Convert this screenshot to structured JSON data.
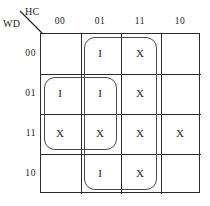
{
  "kmap": {
    "column_variables_label": "HC",
    "row_variables_label": "WD",
    "column_headers": [
      "00",
      "01",
      "11",
      "10"
    ],
    "row_headers": [
      "00",
      "01",
      "11",
      "10"
    ],
    "cells": [
      [
        "",
        "I",
        "X",
        ""
      ],
      [
        "I",
        "I",
        "X",
        ""
      ],
      [
        "X",
        "X",
        "X",
        "X"
      ],
      [
        "",
        "I",
        "X",
        ""
      ]
    ],
    "groups": [
      {
        "name": "vertical-group-columns-01-11",
        "cells": "columns 01 and 11, all four rows",
        "left": 84,
        "top": 37,
        "width": 73,
        "height": 153
      },
      {
        "name": "square-group-rows-01-11-columns-00-01",
        "cells": "rows 01 and 11, columns 00 and 01",
        "left": 44,
        "top": 77,
        "width": 73,
        "height": 73
      }
    ],
    "colors": {
      "grid_line": "#2b2b2b",
      "loop_outline": "#4a4a4a",
      "text": "#1a1a1a",
      "background": "#ffffff"
    }
  },
  "chart_data": {
    "type": "table",
    "xlabel": "HC",
    "ylabel": "WD",
    "columns": [
      "00",
      "01",
      "11",
      "10"
    ],
    "rows": [
      "00",
      "01",
      "11",
      "10"
    ],
    "values": [
      [
        "",
        "I",
        "X",
        ""
      ],
      [
        "I",
        "I",
        "X",
        ""
      ],
      [
        "X",
        "X",
        "X",
        "X"
      ],
      [
        "",
        "I",
        "X",
        ""
      ]
    ],
    "legend": [
      "I = logic one",
      "X = don't care",
      "blank = logic zero"
    ],
    "annotations": [
      "Loop over columns 01 and 11 spanning all four rows",
      "Loop over rows 01 and 11 across columns 00 and 01"
    ],
    "grid": true
  }
}
